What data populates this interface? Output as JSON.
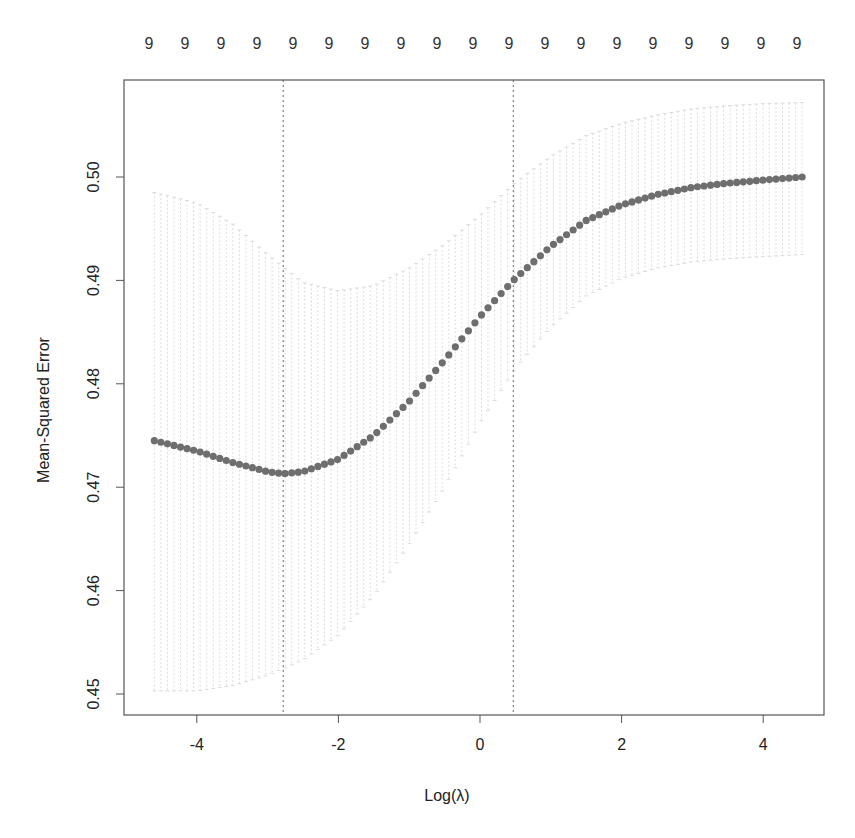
{
  "chart_data": {
    "type": "scatter",
    "title": "",
    "xlabel": "Log(λ)",
    "ylabel": "Mean-Squared Error",
    "xlim": [
      -4.9,
      5.0
    ],
    "ylim": [
      0.4487,
      0.5101
    ],
    "x_ticks": [
      -4,
      -2,
      0,
      2,
      4
    ],
    "x_tick_labels": [
      "-4",
      "-2",
      "0",
      "2",
      "4"
    ],
    "y_ticks": [
      0.45,
      0.46,
      0.47,
      0.48,
      0.49,
      0.5
    ],
    "y_tick_labels": [
      "0.45",
      "0.46",
      "0.47",
      "0.48",
      "0.49",
      "0.50"
    ],
    "top_axis_labels": [
      "9",
      "9",
      "9",
      "9",
      "9",
      "9",
      "9",
      "9",
      "9",
      "9",
      "9",
      "9",
      "9",
      "9",
      "9",
      "9",
      "9",
      "9",
      "9"
    ],
    "grid": false,
    "legend": null,
    "vlines": [
      {
        "name": "lambda.min",
        "x": -2.78,
        "style": "dotted"
      },
      {
        "name": "lambda.1se",
        "x": 0.47,
        "style": "dotted"
      }
    ],
    "series": [
      {
        "name": "cv_mean",
        "color": "#6e6e6e",
        "marker": "circle",
        "x": [
          -4.6,
          -4.0,
          -3.5,
          -3.0,
          -2.78,
          -2.5,
          -2.0,
          -1.5,
          -1.0,
          -0.5,
          0.0,
          0.47,
          1.0,
          1.5,
          2.0,
          2.5,
          3.0,
          3.5,
          4.0,
          4.55
        ],
        "values": [
          0.4745,
          0.4735,
          0.4724,
          0.4715,
          0.4713,
          0.4715,
          0.4727,
          0.475,
          0.4783,
          0.4823,
          0.4865,
          0.49,
          0.4933,
          0.4958,
          0.4973,
          0.4983,
          0.499,
          0.4994,
          0.4997,
          0.5
        ]
      },
      {
        "name": "upper_band",
        "color": "#c8c8c8",
        "x": [
          -4.6,
          -4.0,
          -3.5,
          -3.0,
          -2.5,
          -2.0,
          -1.5,
          -1.0,
          -0.5,
          0.0,
          0.5,
          1.0,
          1.5,
          2.0,
          2.5,
          3.0,
          3.5,
          4.0,
          4.55
        ],
        "values": [
          0.4985,
          0.4975,
          0.4955,
          0.4925,
          0.4898,
          0.489,
          0.4895,
          0.4912,
          0.4935,
          0.4963,
          0.4995,
          0.502,
          0.504,
          0.5052,
          0.506,
          0.5066,
          0.5069,
          0.5071,
          0.5072
        ]
      },
      {
        "name": "lower_band",
        "color": "#c8c8c8",
        "x": [
          -4.6,
          -4.0,
          -3.5,
          -3.0,
          -2.5,
          -2.0,
          -1.5,
          -1.0,
          -0.5,
          0.0,
          0.5,
          1.0,
          1.5,
          2.0,
          2.5,
          3.0,
          3.5,
          4.0,
          4.55
        ],
        "values": [
          0.4503,
          0.4503,
          0.4508,
          0.4518,
          0.4533,
          0.4557,
          0.4595,
          0.4645,
          0.47,
          0.4762,
          0.4815,
          0.4855,
          0.4885,
          0.4902,
          0.4912,
          0.4918,
          0.4921,
          0.4923,
          0.4925
        ]
      }
    ]
  }
}
